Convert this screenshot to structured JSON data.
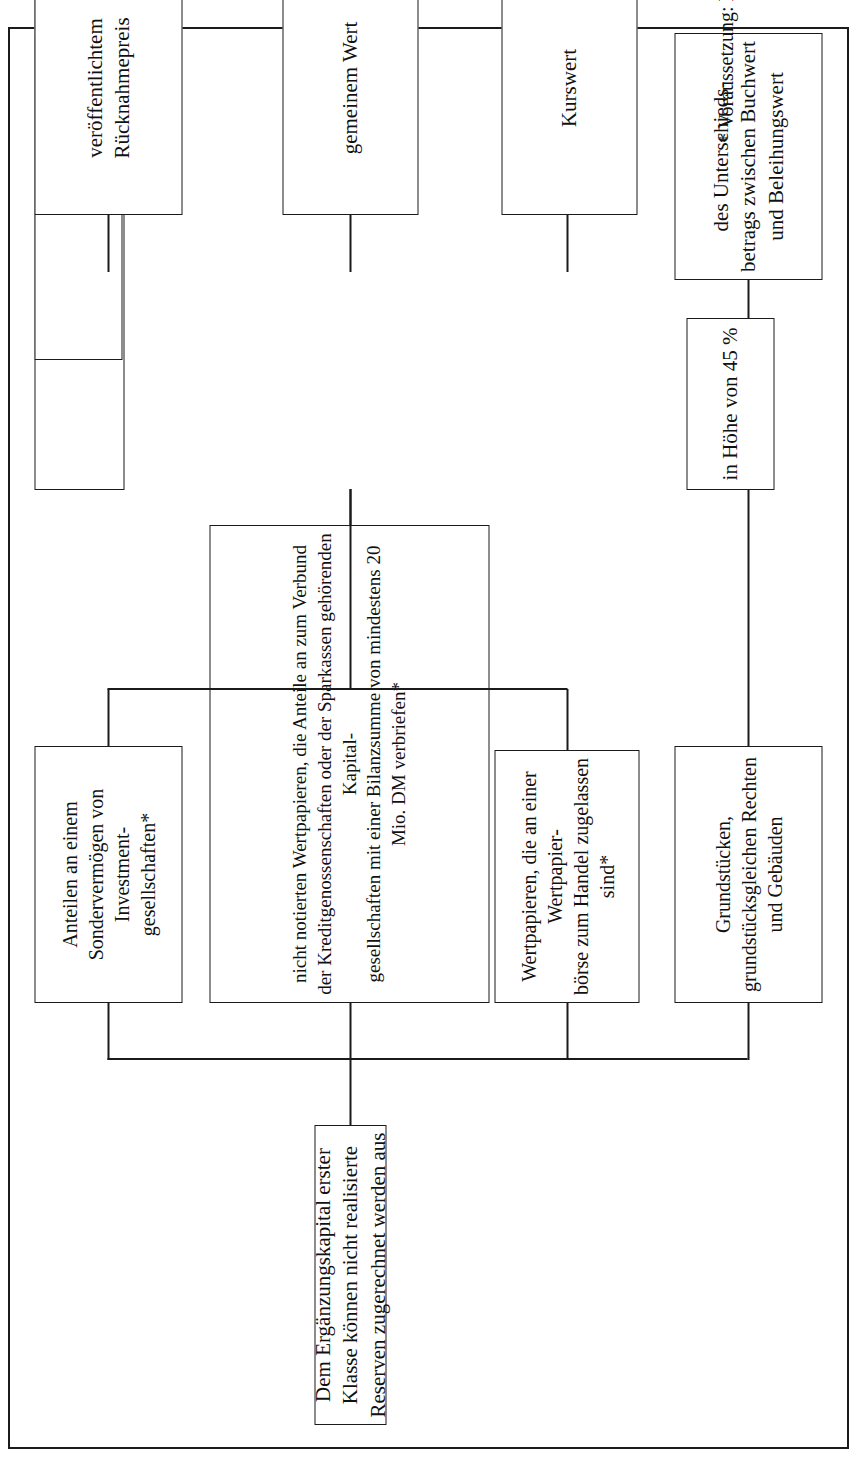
{
  "diagram": {
    "title_box": "Dem Ergänzungskapital erster Klasse können nicht realisierte Reserven zugerechnet werden aus",
    "sources": [
      {
        "id": "grundstuecke",
        "text": "Grundstücken, grundstücksgleichen Rechten und Gebäuden"
      },
      {
        "id": "wertpapiere-boerse",
        "text": "Wertpapieren, die an einer Wertpapier-\nbörse zum Handel zugelassen sind*"
      },
      {
        "id": "wertpapiere-nicht-notiert",
        "text": "nicht notierten Wertpapieren, die Anteile an zum Verbund der Kreditgenossenschaften oder der Sparkassen gehörenden Kapital-\ngesellschaften mit einer Bilanzsumme von mindestens 20 Mio. DM verbriefen*"
      },
      {
        "id": "investmentanteile",
        "text": "Anteilen an einem Sondervermögen von Investment-\ngesellschaften*"
      }
    ],
    "rates": [
      {
        "id": "rate-45",
        "text": "in Höhe von 45 %"
      },
      {
        "id": "rate-35",
        "text": "in Höhe von 35 %"
      }
    ],
    "differences": [
      {
        "id": "diff-beleihungswert",
        "text": "des Unterschieds-\nbetrags zwischen Buchwert und Beleihungswert"
      },
      {
        "id": "diff-buchwert",
        "text": "des Unterschiedsbetrags zwischen Buchwert (zuzüglich Vorsorgereserven) und"
      }
    ],
    "values": [
      {
        "id": "kurswert",
        "text": "Kurswert"
      },
      {
        "id": "gemeiner-wert",
        "text": "gemeinem Wert"
      },
      {
        "id": "ruecknahmepreis",
        "text": "veröffentlichtem Rücknahmepreis"
      }
    ],
    "footnote": "*  Voraussetzung: Es handelt sich um Anlagebuchpositionen",
    "colors": {
      "line": "#1b1b1b",
      "background": "#ffffff",
      "text": "#111111"
    }
  }
}
